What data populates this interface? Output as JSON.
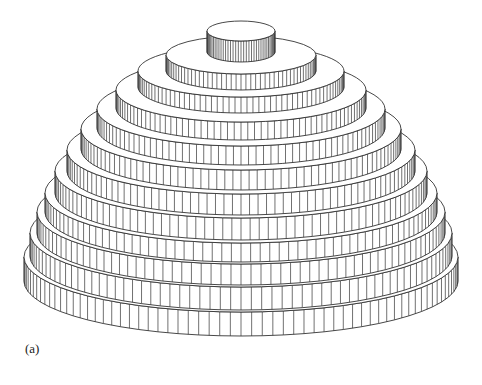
{
  "figure": {
    "caption_label": "(a)",
    "center_x": 241,
    "stroke_color": "#333333",
    "fill_color": "#ffffff",
    "tiers": [
      {
        "rx": 34,
        "top_y": 41,
        "bottom_y": 62,
        "ry": 10,
        "hatch_count": 40
      },
      {
        "rx": 75,
        "top_y": 74,
        "bottom_y": 90,
        "ry": 19,
        "hatch_count": 48
      },
      {
        "rx": 103,
        "top_y": 97,
        "bottom_y": 113,
        "ry": 26,
        "hatch_count": 54
      },
      {
        "rx": 125,
        "top_y": 122,
        "bottom_y": 140,
        "ry": 32,
        "hatch_count": 58
      },
      {
        "rx": 144,
        "top_y": 146,
        "bottom_y": 165,
        "ry": 37,
        "hatch_count": 60
      },
      {
        "rx": 160,
        "top_y": 170,
        "bottom_y": 190,
        "ry": 41,
        "hatch_count": 62
      },
      {
        "rx": 174,
        "top_y": 194,
        "bottom_y": 215,
        "ry": 44,
        "hatch_count": 64
      },
      {
        "rx": 186,
        "top_y": 218,
        "bottom_y": 240,
        "ry": 47,
        "hatch_count": 64
      },
      {
        "rx": 196,
        "top_y": 243,
        "bottom_y": 262,
        "ry": 50,
        "hatch_count": 64
      },
      {
        "rx": 204,
        "top_y": 264,
        "bottom_y": 285,
        "ry": 52,
        "hatch_count": 64
      },
      {
        "rx": 211,
        "top_y": 287,
        "bottom_y": 310,
        "ry": 54,
        "hatch_count": 64
      },
      {
        "rx": 217,
        "top_y": 312,
        "bottom_y": 336,
        "ry": 55,
        "hatch_count": 64
      }
    ]
  }
}
